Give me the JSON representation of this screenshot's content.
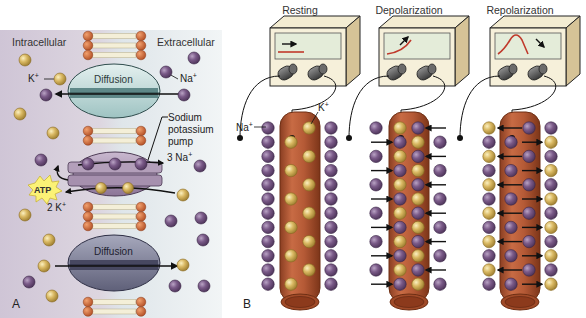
{
  "panel_a": {
    "label": "A",
    "intracellular_label": "Intracellular",
    "extracellular_label": "Extracellular",
    "k_label": "K",
    "k_sup": "+",
    "na_label": "Na",
    "na_sup": "+",
    "diffusion_top_label": "Diffusion",
    "diffusion_bottom_label": "Diffusion",
    "pump_label_lines": [
      "Sodium",
      "potassium",
      "pump"
    ],
    "pump_na_label": "3 Na",
    "pump_na_sup": "+",
    "pump_k_label": "2 K",
    "pump_k_sup": "+",
    "atp_label": "ATP"
  },
  "panel_b": {
    "label": "B",
    "na_label": "Na",
    "na_sup": "+",
    "k_label": "K",
    "k_sup": "+",
    "stages": [
      {
        "title": "Resting",
        "trace": "flat"
      },
      {
        "title": "Depolarization",
        "trace": "rising"
      },
      {
        "title": "Repolarization",
        "trace": "peak"
      }
    ]
  },
  "colors": {
    "sodium": "#6e4d7c",
    "potassium": "#d6b45a",
    "lipid_head": "#c9643a",
    "axon": "#b8603a",
    "diffusion_channel_top": "#c5dedd",
    "diffusion_channel_bottom": "#7f8098",
    "pump": "#a894b0",
    "atp": "#fbf276",
    "trace": "#c0392b",
    "intracellular_bg": "#d7cfdc",
    "extracellular_bg": "#e2e8ec"
  }
}
